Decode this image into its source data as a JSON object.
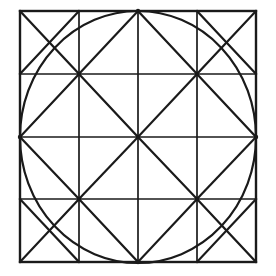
{
  "figure": {
    "background_color": "#ffffff",
    "ink_color": "#1a1a1a"
  },
  "geometry": {
    "square": {
      "name": "outer-square",
      "left": 20,
      "top": 11,
      "right": 256,
      "bottom": 262,
      "width": 236,
      "height": 251,
      "stroke_width": 2.4
    },
    "grid": {
      "name": "grid-4x4",
      "columns": 4,
      "rows": 4,
      "vertical_x": [
        79,
        138,
        197
      ],
      "horizontal_y": [
        74,
        137,
        199
      ],
      "stroke_width": 1.7
    },
    "circle": {
      "name": "inscribed-circle",
      "center_x": 138,
      "center_y": 137,
      "radius_x": 118,
      "radius_y": 126,
      "stroke_width": 2.2
    },
    "diagonals": {
      "stroke_width": 2.2,
      "segments": [
        {
          "name": "diag-center-up-left",
          "x1": 138,
          "y1": 137,
          "x2": 79,
          "y2": 74
        },
        {
          "name": "diag-center-up-right",
          "x1": 138,
          "y1": 137,
          "x2": 197,
          "y2": 74
        },
        {
          "name": "diag-center-down-left",
          "x1": 138,
          "y1": 137,
          "x2": 79,
          "y2": 199
        },
        {
          "name": "diag-center-down-right",
          "x1": 138,
          "y1": 137,
          "x2": 197,
          "y2": 199
        },
        {
          "name": "diag-topmid-to-left",
          "x1": 138,
          "y1": 11,
          "x2": 79,
          "y2": 74
        },
        {
          "name": "diag-topmid-to-right",
          "x1": 138,
          "y1": 11,
          "x2": 197,
          "y2": 74
        },
        {
          "name": "diag-botmid-to-left",
          "x1": 138,
          "y1": 262,
          "x2": 79,
          "y2": 199
        },
        {
          "name": "diag-botmid-to-right",
          "x1": 138,
          "y1": 262,
          "x2": 197,
          "y2": 199
        },
        {
          "name": "diag-leftmid-to-top",
          "x1": 20,
          "y1": 137,
          "x2": 79,
          "y2": 74
        },
        {
          "name": "diag-leftmid-to-bottom",
          "x1": 20,
          "y1": 137,
          "x2": 79,
          "y2": 199
        },
        {
          "name": "diag-rightmid-to-top",
          "x1": 256,
          "y1": 137,
          "x2": 197,
          "y2": 74
        },
        {
          "name": "diag-rightmid-to-bottom",
          "x1": 256,
          "y1": 137,
          "x2": 197,
          "y2": 199
        },
        {
          "name": "diag-corner-tl-main",
          "x1": 20,
          "y1": 11,
          "x2": 79,
          "y2": 74
        },
        {
          "name": "diag-corner-tl-anti",
          "x1": 79,
          "y1": 11,
          "x2": 20,
          "y2": 74
        },
        {
          "name": "diag-corner-tr-main",
          "x1": 256,
          "y1": 11,
          "x2": 197,
          "y2": 74
        },
        {
          "name": "diag-corner-tr-anti",
          "x1": 197,
          "y1": 11,
          "x2": 256,
          "y2": 74
        },
        {
          "name": "diag-corner-bl-main",
          "x1": 20,
          "y1": 262,
          "x2": 79,
          "y2": 199
        },
        {
          "name": "diag-corner-bl-anti",
          "x1": 79,
          "y1": 262,
          "x2": 20,
          "y2": 199
        },
        {
          "name": "diag-corner-br-main",
          "x1": 256,
          "y1": 262,
          "x2": 197,
          "y2": 199
        },
        {
          "name": "diag-corner-br-anti",
          "x1": 197,
          "y1": 262,
          "x2": 256,
          "y2": 199
        }
      ]
    },
    "vertices": {
      "name": "grid-intersection-nodes",
      "points": [
        {
          "name": "node-center",
          "x": 138,
          "y": 137
        },
        {
          "name": "node-inner-tl",
          "x": 79,
          "y": 74
        },
        {
          "name": "node-inner-tr",
          "x": 197,
          "y": 74
        },
        {
          "name": "node-inner-bl",
          "x": 79,
          "y": 199
        },
        {
          "name": "node-inner-br",
          "x": 197,
          "y": 199
        },
        {
          "name": "node-top-mid",
          "x": 138,
          "y": 11
        },
        {
          "name": "node-bottom-mid",
          "x": 138,
          "y": 262
        },
        {
          "name": "node-left-mid",
          "x": 20,
          "y": 137
        },
        {
          "name": "node-right-mid",
          "x": 256,
          "y": 137
        }
      ]
    }
  }
}
